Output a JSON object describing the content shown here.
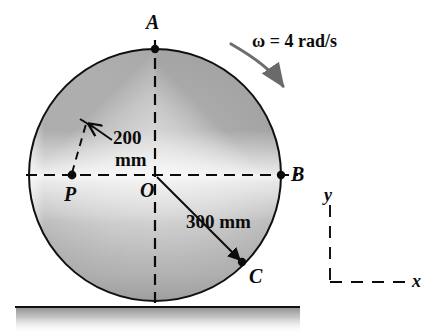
{
  "figure": {
    "points": {
      "a": "A",
      "b": "B",
      "c": "C",
      "p": "P",
      "o": "O"
    },
    "dimensions": {
      "r_op_value": "200",
      "r_op_unit": "mm",
      "r_oc": "300 mm"
    },
    "angular_velocity": {
      "symbol": "ω",
      "equals": "=",
      "value": "4",
      "unit": "rad/s",
      "full": "ω = 4 rad/s"
    },
    "axes": {
      "x": "x",
      "y": "y"
    },
    "colors": {
      "ink": "#0b0b0b",
      "disk_light": "#efefef",
      "disk_mid": "#b4b4b4",
      "disk_dark": "#8a8a8a",
      "ground": "#9a9a9a"
    }
  }
}
